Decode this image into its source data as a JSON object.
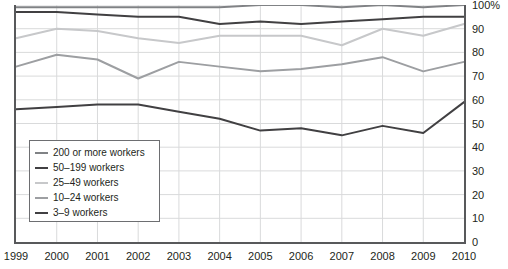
{
  "chart_data": {
    "type": "line",
    "title": "",
    "xlabel": "",
    "ylabel": "",
    "x": [
      1999,
      2000,
      2001,
      2002,
      2003,
      2004,
      2005,
      2006,
      2007,
      2008,
      2009,
      2010
    ],
    "xtick_labels": [
      "1999",
      "2000",
      "2001",
      "2002",
      "2003",
      "2004",
      "2005",
      "2006",
      "2007",
      "2008",
      "2009",
      "2010"
    ],
    "ytick_labels": [
      "0",
      "10",
      "20",
      "30",
      "40",
      "50",
      "60",
      "70",
      "80",
      "90",
      "100%"
    ],
    "yticks": [
      0,
      10,
      20,
      30,
      40,
      50,
      60,
      70,
      80,
      90,
      100
    ],
    "ylim": [
      0,
      100
    ],
    "xlim": [
      1999,
      2010
    ],
    "grid": true,
    "legend_position": "lower-left-inside",
    "series": [
      {
        "name": "200 or more workers",
        "color": "#808285",
        "width": 2,
        "values": [
          99,
          99,
          99,
          99,
          99,
          99,
          100,
          100,
          99,
          100,
          99,
          100
        ]
      },
      {
        "name": "50–199 workers",
        "color": "#414042",
        "width": 2,
        "values": [
          97,
          97,
          96,
          95,
          95,
          92,
          93,
          92,
          93,
          94,
          95,
          95
        ]
      },
      {
        "name": "25–49 workers",
        "color": "#c7c8ca",
        "width": 2,
        "values": [
          86,
          90,
          89,
          86,
          84,
          87,
          87,
          87,
          83,
          90,
          87,
          92
        ]
      },
      {
        "name": "10–24 workers",
        "color": "#9d9fa2",
        "width": 2,
        "values": [
          74,
          79,
          77,
          69,
          76,
          74,
          72,
          73,
          75,
          78,
          72,
          76
        ]
      },
      {
        "name": "3–9 workers",
        "color": "#414042",
        "width": 2,
        "values": [
          56,
          57,
          58,
          58,
          55,
          52,
          47,
          48,
          45,
          49,
          46,
          59
        ]
      }
    ]
  }
}
